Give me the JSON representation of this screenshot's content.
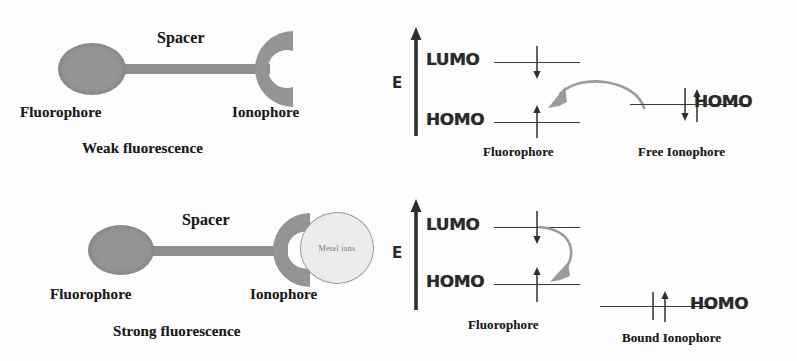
{
  "figure": {
    "type": "diagram",
    "background_color": "#fdfdfd",
    "shape_gray": "#949494",
    "arrow_gray": "#9b9b9b",
    "level_color": "#3a3a3a",
    "metal_fill": "#ececec"
  },
  "panels": {
    "top_left": {
      "name": "weak-fluorescence-molecule",
      "spacer_label": "Spacer",
      "fluorophore_label": "Fluorophore",
      "ionophore_label": "Ionophore",
      "caption": "Weak fluorescence"
    },
    "bottom_left": {
      "name": "strong-fluorescence-molecule",
      "spacer_label": "Spacer",
      "fluorophore_label": "Fluorophore",
      "ionophore_label": "Ionophore",
      "metal_label": "Metal ions",
      "caption": "Strong fluorescence"
    },
    "top_right": {
      "name": "free-ionophore-energy-diagram",
      "axis_label": "E",
      "lumo_label": "LUMO",
      "homo_label": "HOMO",
      "donor_homo_label": "HOMO",
      "left_caption": "Fluorophore",
      "right_caption": "Free Ionophore",
      "transfer": "electron transfer from ionophore HOMO to fluorophore HOMO"
    },
    "bottom_right": {
      "name": "bound-ionophore-energy-diagram",
      "axis_label": "E",
      "lumo_label": "LUMO",
      "homo_label": "HOMO",
      "donor_homo_label": "HOMO",
      "left_caption": "Fluorophore",
      "right_caption": "Bound Ionophore",
      "transfer": "radiative relaxation from fluorophore LUMO to HOMO"
    }
  }
}
